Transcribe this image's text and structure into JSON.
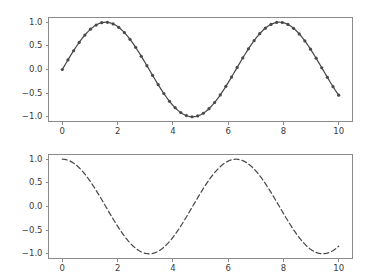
{
  "figure": {
    "background_color": "#ffffff",
    "line_color": "#4a4a4a",
    "spine_color": "#8a8a8a",
    "tick_label_color": "#3b3b3b",
    "width": 366,
    "height": 275
  },
  "chart_data": [
    {
      "type": "line",
      "name": "sine-with-markers",
      "title": "",
      "xlabel": "",
      "ylabel": "",
      "xlim": [
        -0.5,
        10.5
      ],
      "ylim": [
        -1.1,
        1.1
      ],
      "grid": false,
      "legend": null,
      "line_style": "solid",
      "marker": "circle",
      "marker_size": 3.2,
      "color": "#4a4a4a",
      "xticks": [
        0,
        2,
        4,
        6,
        8,
        10
      ],
      "xtick_labels": [
        "0",
        "2",
        "4",
        "6",
        "8",
        "10"
      ],
      "yticks": [
        -1.0,
        -0.5,
        0.0,
        0.5,
        1.0
      ],
      "ytick_labels": [
        "-1.0",
        "-0.5",
        "0.0",
        "0.5",
        "1.0"
      ],
      "x": [
        0.0,
        0.2041,
        0.4082,
        0.6122,
        0.8163,
        1.0204,
        1.2245,
        1.4286,
        1.6327,
        1.8367,
        2.0408,
        2.2449,
        2.449,
        2.6531,
        2.8571,
        3.0612,
        3.2653,
        3.4694,
        3.6735,
        3.8776,
        4.0816,
        4.2857,
        4.4898,
        4.6939,
        4.898,
        5.102,
        5.3061,
        5.5102,
        5.7143,
        5.9184,
        6.1224,
        6.3265,
        6.5306,
        6.7347,
        6.9388,
        7.1429,
        7.3469,
        7.551,
        7.7551,
        7.9592,
        8.1633,
        8.3673,
        8.5714,
        8.7755,
        8.9796,
        9.1837,
        9.3878,
        9.5918,
        9.7959,
        10.0
      ],
      "y": [
        0.0,
        0.2027,
        0.3971,
        0.5748,
        0.7283,
        0.8526,
        0.9427,
        0.9898,
        0.998,
        0.9636,
        0.8898,
        0.7789,
        0.6367,
        0.4695,
        0.2837,
        0.0872,
        -0.1125,
        -0.3056,
        -0.4848,
        -0.6428,
        -0.7727,
        -0.8716,
        -0.9373,
        -0.9692,
        -0.9671,
        -0.9313,
        -0.8625,
        -0.7643,
        -0.6395,
        -0.4929,
        -0.3301,
        -0.1575,
        0.0185,
        0.192,
        0.3569,
        0.5074,
        0.6387,
        0.7464,
        0.8269,
        0.8783,
        0.9,
        0.8912,
        0.8523,
        0.7851,
        0.6921,
        0.5767,
        0.4428,
        0.2954,
        0.1392,
        -0.544
      ]
    },
    {
      "type": "line",
      "name": "cosine-dashed",
      "title": "",
      "xlabel": "",
      "ylabel": "",
      "xlim": [
        -0.5,
        10.5
      ],
      "ylim": [
        -1.1,
        1.1
      ],
      "grid": false,
      "legend": null,
      "line_style": "dashed",
      "marker": "none",
      "dash_pattern": [
        5,
        3
      ],
      "color": "#4a4a4a",
      "xticks": [
        0,
        2,
        4,
        6,
        8,
        10
      ],
      "xtick_labels": [
        "0",
        "2",
        "4",
        "6",
        "8",
        "10"
      ],
      "yticks": [
        -1.0,
        -0.5,
        0.0,
        0.5,
        1.0
      ],
      "ytick_labels": [
        "-1.0",
        "-0.5",
        "0.0",
        "0.5",
        "1.0"
      ],
      "x_range": [
        0,
        10
      ],
      "function": "cos(x)",
      "key_points": [
        {
          "x": 0.0,
          "y": 1.0
        },
        {
          "x": 3.1416,
          "y": -1.0
        },
        {
          "x": 6.2832,
          "y": 1.0
        },
        {
          "x": 9.4248,
          "y": -1.0
        },
        {
          "x": 10.0,
          "y": -0.8391
        }
      ]
    }
  ]
}
